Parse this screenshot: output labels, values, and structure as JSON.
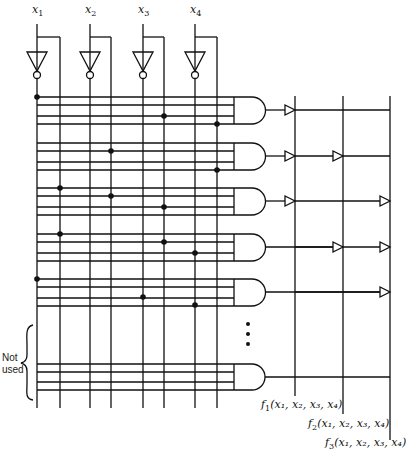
{
  "inputs": [
    {
      "label": "x",
      "sub": "1"
    },
    {
      "label": "x",
      "sub": "2"
    },
    {
      "label": "x",
      "sub": "3"
    },
    {
      "label": "x",
      "sub": "4"
    }
  ],
  "outputs": [
    {
      "label": "f",
      "sub": "1",
      "args": "(x₁, x₂, x₃, x₄)"
    },
    {
      "label": "f",
      "sub": "2",
      "args": "(x₁, x₂, x₃, x₄)"
    },
    {
      "label": "f",
      "sub": "3",
      "args": "(x₁, x₂, x₃, x₄)"
    }
  ],
  "not_used_label": "Not used",
  "ellipsis": "⋮",
  "and_gates": [
    {
      "rows": [
        {
          "dot_col": "x1_inv"
        },
        {
          "dot_col": null
        },
        {
          "dot_col": "x3_true"
        },
        {
          "dot_col": "x4_true"
        }
      ],
      "or_connections": [
        "f1"
      ]
    },
    {
      "rows": [
        {
          "dot_col": null
        },
        {
          "dot_col": "x2_true"
        },
        {
          "dot_col": null
        },
        {
          "dot_col": "x4_true"
        }
      ],
      "or_connections": [
        "f1",
        "f2"
      ]
    },
    {
      "rows": [
        {
          "dot_col": "x1_true"
        },
        {
          "dot_col": "x2_true"
        },
        {
          "dot_col": "x3_true"
        },
        {
          "dot_col": null
        }
      ],
      "or_connections": [
        "f1",
        "f3"
      ]
    },
    {
      "rows": [
        {
          "dot_col": "x1_true"
        },
        {
          "dot_col": null
        },
        {
          "dot_col": "x3_true"
        },
        {
          "dot_col": "x4_inv"
        }
      ],
      "or_connections": [
        "f2",
        "f3"
      ]
    },
    {
      "rows": [
        {
          "dot_col": "x1_inv"
        },
        {
          "dot_col": null
        },
        {
          "dot_col": "x3_inv"
        },
        {
          "dot_col": "x4_inv"
        }
      ],
      "or_connections": [
        "f3"
      ]
    },
    {
      "rows": [
        {
          "dot_col": null
        },
        {
          "dot_col": null
        },
        {
          "dot_col": null
        },
        {
          "dot_col": null
        }
      ],
      "or_connections": [],
      "unused": true
    }
  ]
}
